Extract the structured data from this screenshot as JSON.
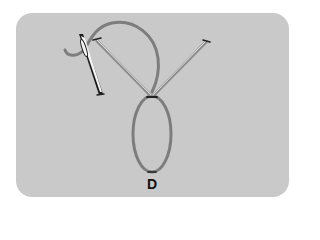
{
  "figure": {
    "step_label": "D",
    "colors": {
      "background": "#ffffff",
      "panel": "#c9c9c9",
      "thread": "#7d7d7d",
      "stitch": "#8a8a8a",
      "needle_dark": "#1a1a1a",
      "needle_light": "#f2f2f2",
      "label": "#111111"
    }
  }
}
